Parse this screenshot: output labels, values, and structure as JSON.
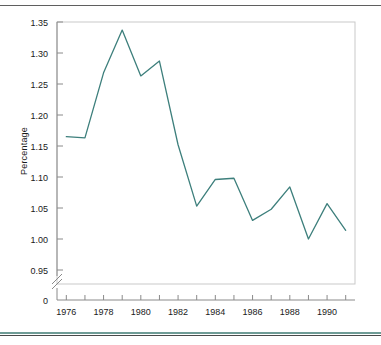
{
  "figure": {
    "top_caption_fragment": "",
    "background_color": "#ffffff",
    "line_color": "#3d7f7c",
    "axis_color": "#8a8a8a",
    "text_color": "#1a1a1a",
    "rule_color": "#6f9c96"
  },
  "chart_data": {
    "type": "line",
    "title": "",
    "xlabel": "",
    "ylabel": "Percentage",
    "x": [
      1976,
      1977,
      1978,
      1979,
      1980,
      1981,
      1982,
      1983,
      1984,
      1985,
      1986,
      1987,
      1988,
      1989,
      1990,
      1991
    ],
    "values": [
      1.165,
      1.163,
      1.268,
      1.337,
      1.263,
      1.287,
      1.152,
      1.053,
      1.096,
      1.098,
      1.03,
      1.048,
      1.084,
      1.0,
      1.057,
      1.014
    ],
    "series": [
      {
        "name": "Percentage",
        "values": [
          1.165,
          1.163,
          1.268,
          1.337,
          1.263,
          1.287,
          1.152,
          1.053,
          1.096,
          1.098,
          1.03,
          1.048,
          1.084,
          1.0,
          1.057,
          1.014
        ]
      }
    ],
    "xlim": [
      1975.5,
      1991.5
    ],
    "ylim": [
      0.925,
      1.35
    ],
    "y_axis_break": true,
    "y_break_between": [
      0,
      0.95
    ],
    "ytick_labels": [
      "1.35",
      "1.30",
      "1.25",
      "1.20",
      "1.15",
      "1.10",
      "1.05",
      "1.00",
      "0.95",
      "0"
    ],
    "ytick_values": [
      1.35,
      1.3,
      1.25,
      1.2,
      1.15,
      1.1,
      1.05,
      1.0,
      0.95,
      0
    ],
    "xtick_labels": [
      "1976",
      "1978",
      "1980",
      "1982",
      "1984",
      "1986",
      "1988",
      "1990"
    ],
    "xtick_values": [
      1976,
      1978,
      1980,
      1982,
      1984,
      1986,
      1988,
      1990
    ],
    "xtick_minor_values": [
      1977,
      1979,
      1981,
      1983,
      1985,
      1987,
      1989,
      1991
    ],
    "grid": false,
    "legend": null,
    "legend_position": "none",
    "markers": false,
    "annotations": []
  }
}
